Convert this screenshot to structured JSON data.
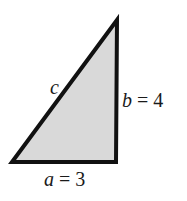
{
  "diagram": {
    "type": "right-triangle",
    "fill_color": "#d9d9d9",
    "stroke_color": "#111111",
    "vertices": {
      "top": [
        117,
        20
      ],
      "bottom_left": [
        12,
        162
      ],
      "bottom_right": [
        116,
        162
      ]
    },
    "labels": {
      "hypotenuse": {
        "var": "c",
        "value": ""
      },
      "vertical": {
        "var": "b",
        "eq": " = ",
        "value": "4"
      },
      "horizontal": {
        "var": "a",
        "eq": " = ",
        "value": "3"
      }
    }
  }
}
